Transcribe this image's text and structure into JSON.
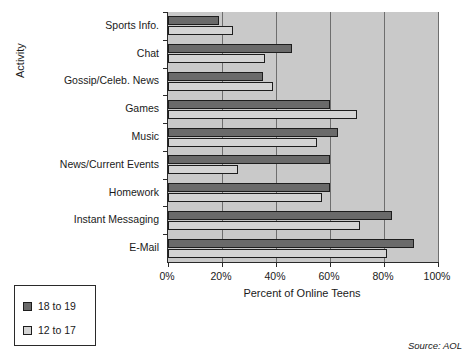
{
  "chart_data": {
    "type": "bar",
    "orientation": "horizontal",
    "title": "",
    "xlabel": "Percent of Online Teens",
    "ylabel": "Activity",
    "xlim": [
      0,
      100
    ],
    "xticks": [
      "0%",
      "20%",
      "40%",
      "60%",
      "80%",
      "100%"
    ],
    "xtick_values": [
      0,
      20,
      40,
      60,
      80,
      100
    ],
    "grid": true,
    "legend_position": "lower-left-outside",
    "categories": [
      "Sports Info.",
      "Chat",
      "Gossip/Celeb. News",
      "Games",
      "Music",
      "News/Current Events",
      "Homework",
      "Instant Messaging",
      "E-Mail"
    ],
    "series": [
      {
        "name": "18 to 19",
        "color": "#6a6a6a",
        "values": [
          19,
          46,
          35,
          60,
          63,
          60,
          60,
          83,
          91
        ]
      },
      {
        "name": "12 to 17",
        "color": "#d4d4d4",
        "values": [
          24,
          36,
          39,
          70,
          55,
          26,
          57,
          71,
          81
        ]
      }
    ],
    "source": "Source: AOL"
  },
  "legend": {
    "items": [
      {
        "label": "18 to 19",
        "swatch": "dark"
      },
      {
        "label": "12 to 17",
        "swatch": "light"
      }
    ]
  }
}
